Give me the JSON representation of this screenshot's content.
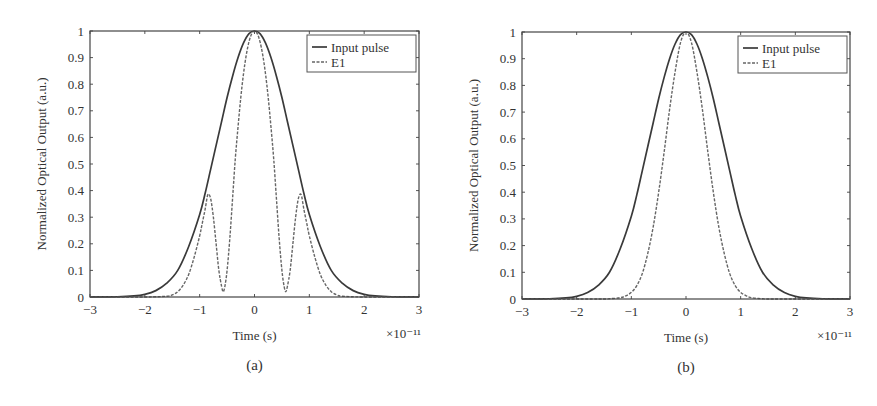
{
  "chart_data": [
    {
      "id": "a",
      "type": "line",
      "caption": "(a)",
      "title": "",
      "xlabel": "Time (s)",
      "x_multiplier": "×10⁻¹¹",
      "ylabel": "Normalized Optical Output (a.u.)",
      "xlim": [
        -3,
        3
      ],
      "ylim": [
        0,
        1
      ],
      "xticks": [
        -3,
        -2,
        -1,
        0,
        1,
        2,
        3
      ],
      "yticks": [
        0,
        0.1,
        0.2,
        0.3,
        0.4,
        0.5,
        0.6,
        0.7,
        0.8,
        0.9,
        1
      ],
      "ytick_labels": [
        "0",
        "0.1",
        "0.2",
        "0.3",
        "0.4",
        "0.5",
        "0.6",
        "0.7",
        "0.8",
        "0.9",
        "1"
      ],
      "grid": false,
      "legend_position": "upper right",
      "series": [
        {
          "name": "Input pulse",
          "style": "solid",
          "x": [
            -3,
            -2.5,
            -2.2,
            -2,
            -1.8,
            -1.6,
            -1.4,
            -1.2,
            -1.0,
            -0.9,
            -0.8,
            -0.7,
            -0.6,
            -0.5,
            -0.4,
            -0.3,
            -0.2,
            -0.1,
            0,
            0.1,
            0.2,
            0.3,
            0.4,
            0.5,
            0.6,
            0.7,
            0.8,
            0.9,
            1.0,
            1.2,
            1.4,
            1.6,
            1.8,
            2,
            2.2,
            2.5,
            3
          ],
          "y": [
            0,
            0.001,
            0.004,
            0.01,
            0.024,
            0.052,
            0.1,
            0.19,
            0.31,
            0.39,
            0.48,
            0.57,
            0.66,
            0.75,
            0.83,
            0.9,
            0.955,
            0.99,
            1,
            0.99,
            0.955,
            0.9,
            0.83,
            0.75,
            0.66,
            0.57,
            0.48,
            0.39,
            0.31,
            0.19,
            0.1,
            0.052,
            0.024,
            0.01,
            0.004,
            0.001,
            0
          ]
        },
        {
          "name": "E1",
          "style": "dashed",
          "x": [
            -3,
            -2,
            -1.6,
            -1.5,
            -1.4,
            -1.3,
            -1.2,
            -1.1,
            -1.0,
            -0.95,
            -0.9,
            -0.85,
            -0.8,
            -0.75,
            -0.7,
            -0.65,
            -0.6,
            -0.57,
            -0.54,
            -0.5,
            -0.45,
            -0.4,
            -0.35,
            -0.3,
            -0.25,
            -0.2,
            -0.15,
            -0.1,
            -0.05,
            0,
            0.05,
            0.1,
            0.15,
            0.2,
            0.25,
            0.3,
            0.35,
            0.4,
            0.45,
            0.5,
            0.54,
            0.57,
            0.6,
            0.65,
            0.7,
            0.75,
            0.8,
            0.85,
            0.9,
            0.95,
            1.0,
            1.1,
            1.2,
            1.3,
            1.4,
            1.5,
            1.6,
            2,
            3
          ],
          "y": [
            0,
            0,
            0.003,
            0.008,
            0.02,
            0.045,
            0.085,
            0.15,
            0.23,
            0.28,
            0.33,
            0.385,
            0.37,
            0.3,
            0.2,
            0.1,
            0.04,
            0.02,
            0.04,
            0.1,
            0.22,
            0.37,
            0.52,
            0.64,
            0.75,
            0.84,
            0.91,
            0.96,
            0.99,
            1,
            0.99,
            0.96,
            0.91,
            0.84,
            0.75,
            0.64,
            0.52,
            0.37,
            0.22,
            0.1,
            0.04,
            0.02,
            0.04,
            0.1,
            0.2,
            0.3,
            0.37,
            0.385,
            0.33,
            0.28,
            0.23,
            0.15,
            0.085,
            0.045,
            0.02,
            0.008,
            0.003,
            0,
            0
          ]
        }
      ]
    },
    {
      "id": "b",
      "type": "line",
      "caption": "(b)",
      "title": "",
      "xlabel": "Time (s)",
      "x_multiplier": "×10⁻¹¹",
      "ylabel": "Normalized Optical Output (a.u.)",
      "xlim": [
        -3,
        3
      ],
      "ylim": [
        0,
        1
      ],
      "xticks": [
        -3,
        -2,
        -1,
        0,
        1,
        2,
        3
      ],
      "yticks": [
        0,
        0.1,
        0.2,
        0.3,
        0.4,
        0.5,
        0.6,
        0.7,
        0.8,
        0.9,
        1
      ],
      "ytick_labels": [
        "0",
        "0.1",
        "0.2",
        "0.3",
        "0.4",
        "0.5",
        "0.6",
        "0.7",
        "0.8",
        "0.9",
        "1"
      ],
      "grid": false,
      "legend_position": "upper right",
      "series": [
        {
          "name": "Input pulse",
          "style": "solid",
          "x": [
            -3,
            -2.5,
            -2.2,
            -2,
            -1.8,
            -1.6,
            -1.4,
            -1.2,
            -1.0,
            -0.9,
            -0.8,
            -0.7,
            -0.6,
            -0.5,
            -0.4,
            -0.3,
            -0.2,
            -0.1,
            0,
            0.1,
            0.2,
            0.3,
            0.4,
            0.5,
            0.6,
            0.7,
            0.8,
            0.9,
            1.0,
            1.2,
            1.4,
            1.6,
            1.8,
            2,
            2.2,
            2.5,
            3
          ],
          "y": [
            0,
            0.001,
            0.004,
            0.01,
            0.024,
            0.052,
            0.1,
            0.19,
            0.31,
            0.39,
            0.48,
            0.57,
            0.66,
            0.75,
            0.83,
            0.9,
            0.955,
            0.99,
            1,
            0.99,
            0.955,
            0.9,
            0.83,
            0.75,
            0.66,
            0.57,
            0.48,
            0.39,
            0.31,
            0.19,
            0.1,
            0.052,
            0.024,
            0.01,
            0.004,
            0.001,
            0
          ]
        },
        {
          "name": "E1",
          "style": "dashed",
          "x": [
            -3,
            -1.6,
            -1.4,
            -1.2,
            -1.1,
            -1.0,
            -0.9,
            -0.8,
            -0.7,
            -0.6,
            -0.5,
            -0.4,
            -0.3,
            -0.2,
            -0.1,
            0,
            0.1,
            0.2,
            0.3,
            0.4,
            0.5,
            0.6,
            0.7,
            0.8,
            0.9,
            1.0,
            1.1,
            1.2,
            1.4,
            1.6,
            3
          ],
          "y": [
            0,
            0,
            0.001,
            0.005,
            0.012,
            0.025,
            0.05,
            0.095,
            0.17,
            0.27,
            0.4,
            0.55,
            0.71,
            0.85,
            0.96,
            1,
            0.96,
            0.85,
            0.71,
            0.55,
            0.4,
            0.27,
            0.17,
            0.095,
            0.05,
            0.025,
            0.012,
            0.005,
            0.001,
            0,
            0
          ]
        }
      ]
    }
  ]
}
